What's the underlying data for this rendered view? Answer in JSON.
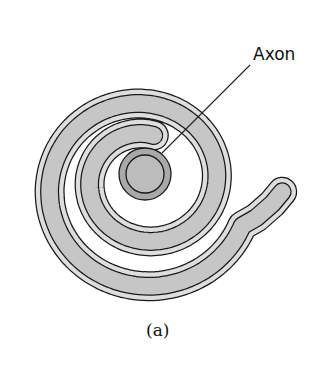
{
  "figure": {
    "labels": {
      "axon": "Axon",
      "caption": "(a)"
    },
    "elements": [
      "myelin-sheath-spiral",
      "axon-cross-section",
      "axon-leader-line"
    ],
    "colors": {
      "outline": "#1a1a1a",
      "sheath_light": "#dedede",
      "sheath_mid": "#c6c6c6",
      "axon_outer": "#a9a9a9",
      "axon_inner": "#bcbcbc",
      "background": "#ffffff"
    }
  }
}
